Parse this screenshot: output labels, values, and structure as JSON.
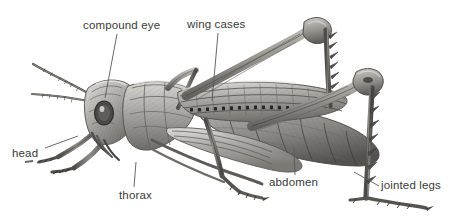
{
  "figure": {
    "background_color": "#ffffff",
    "label_color": "#3a3a3a",
    "leader_line_color": "#55595c",
    "illustration_style": "grayscale engraving"
  },
  "labels": [
    {
      "id": "compound-eye",
      "text": "compound eye"
    },
    {
      "id": "wing-cases",
      "text": "wing cases"
    },
    {
      "id": "head",
      "text": "head"
    },
    {
      "id": "thorax",
      "text": "thorax"
    },
    {
      "id": "abdomen",
      "text": "abdomen"
    },
    {
      "id": "jointed-legs",
      "text": "jointed legs"
    }
  ]
}
